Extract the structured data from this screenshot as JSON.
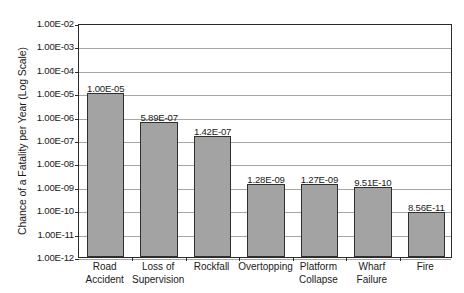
{
  "chart_data": {
    "type": "bar",
    "title": "",
    "xlabel": "",
    "ylabel": "Chance of a Fatality per Year (Log Scale)",
    "scale": "log",
    "grid": true,
    "legend": false,
    "ylim": [
      1e-12,
      0.01
    ],
    "ytick_labels": [
      "1.00E-02",
      "1.00E-03",
      "1.00E-04",
      "1.00E-05",
      "1.00E-06",
      "1.00E-07",
      "1.00E-08",
      "1.00E-09",
      "1.00E-10",
      "1.00E-11",
      "1.00E-12"
    ],
    "ytick_values": [
      0.01,
      0.001,
      0.0001,
      1e-05,
      1e-06,
      1e-07,
      1e-08,
      1e-09,
      1e-10,
      1e-11,
      1e-12
    ],
    "categories": [
      "Road Accident",
      "Loss of Supervision",
      "Rockfall",
      "Overtopping",
      "Platform Collapse",
      "Wharf Failure",
      "Fire"
    ],
    "category_lines": [
      [
        "Road",
        "Accident"
      ],
      [
        "Loss of",
        "Supervision"
      ],
      [
        "Rockfall"
      ],
      [
        "Overtopping"
      ],
      [
        "Platform",
        "Collapse"
      ],
      [
        "Wharf",
        "Failure"
      ],
      [
        "Fire"
      ]
    ],
    "values": [
      1e-05,
      5.89e-07,
      1.42e-07,
      1.28e-09,
      1.27e-09,
      9.51e-10,
      8.56e-11
    ],
    "value_labels": [
      "1.00E-05",
      "5.89E-07",
      "1.42E-07",
      "1.28E-09",
      "1.27E-09",
      "9.51E-10",
      "8.56E-11"
    ],
    "colors": {
      "bar_fill": "#a3a3a3",
      "bar_border": "#2f2f2f",
      "gridline": "#a6a6a6",
      "axis": "#2b2b2b",
      "text": "#1a1a1a",
      "background": "#ffffff"
    }
  }
}
